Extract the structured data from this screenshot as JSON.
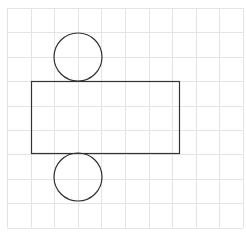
{
  "diagram": {
    "colors": {
      "background": "#ffffff",
      "grid": "#e4e4e4",
      "stroke": "#333333"
    },
    "grid": {
      "x0": 7,
      "y0": 8,
      "cols": 10,
      "rows": 9,
      "cell_w": 23.6,
      "cell_h": 24.4
    },
    "shapes": {
      "rectangle": {
        "x": 31,
        "y": 81,
        "width": 148,
        "height": 72
      },
      "top_circle": {
        "cx": 78,
        "cy": 57,
        "r": 24
      },
      "bottom_circle": {
        "cx": 78,
        "cy": 177,
        "r": 24
      }
    }
  }
}
